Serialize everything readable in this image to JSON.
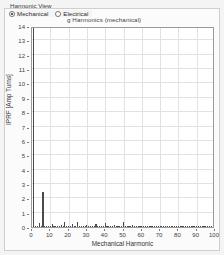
{
  "controls": {
    "group_label": "Harmonic View",
    "options": [
      {
        "label": "Mechanical",
        "selected": true
      },
      {
        "label": "Electrical",
        "selected": false
      }
    ]
  },
  "chart_data": {
    "type": "bar",
    "title": "g Harmonics (mechanical)",
    "xlabel": "Mechanical Harmonic",
    "ylabel": "IPRF [Amp Turns]",
    "xlim": [
      0,
      100
    ],
    "ylim": [
      0,
      14
    ],
    "grid": true,
    "legend": null,
    "xticks": [
      0,
      10,
      20,
      30,
      40,
      50,
      60,
      70,
      80,
      90,
      100
    ],
    "yticks": [
      0,
      1,
      2,
      3,
      4,
      5,
      6,
      7,
      8,
      9,
      10,
      11,
      12,
      13,
      14
    ],
    "bar_color": "#4a4a4a",
    "x": [
      1,
      2,
      3,
      4,
      5,
      6,
      7,
      8,
      9,
      10,
      11,
      12,
      13,
      14,
      15,
      16,
      17,
      18,
      19,
      20,
      21,
      22,
      23,
      24,
      25,
      26,
      27,
      28,
      29,
      30,
      31,
      32,
      33,
      34,
      35,
      36,
      37,
      38,
      39,
      40,
      41,
      42,
      43,
      44,
      45,
      46,
      47,
      48,
      49,
      50,
      51,
      52,
      53,
      54,
      55,
      56,
      57,
      58,
      59,
      60,
      61,
      62,
      63,
      64,
      65,
      66,
      67,
      68,
      69,
      70,
      71,
      72,
      73,
      74,
      75,
      76,
      77,
      78,
      79,
      80,
      81,
      82,
      83,
      84,
      85,
      86,
      87,
      88,
      89,
      90,
      91,
      92,
      93,
      94,
      95,
      96,
      97,
      98,
      99,
      100
    ],
    "values": [
      14.4,
      0.1,
      0.05,
      0.25,
      0.08,
      2.42,
      0.06,
      0.05,
      0.04,
      0.04,
      0.18,
      0.05,
      0.04,
      0.04,
      0.03,
      0.12,
      0.05,
      0.37,
      0.06,
      0.05,
      0.04,
      0.2,
      0.05,
      0.04,
      0.35,
      0.06,
      0.05,
      0.04,
      0.04,
      0.16,
      0.05,
      0.04,
      0.03,
      0.03,
      0.22,
      0.05,
      0.04,
      0.04,
      0.03,
      0.3,
      0.06,
      0.05,
      0.04,
      0.03,
      0.12,
      0.05,
      0.04,
      0.03,
      0.03,
      0.32,
      0.06,
      0.05,
      0.04,
      0.03,
      0.15,
      0.04,
      0.03,
      0.03,
      0.03,
      0.08,
      0.04,
      0.03,
      0.03,
      0.03,
      0.06,
      0.03,
      0.03,
      0.03,
      0.03,
      0.05,
      0.03,
      0.03,
      0.02,
      0.02,
      0.05,
      0.03,
      0.02,
      0.02,
      0.02,
      0.04,
      0.03,
      0.02,
      0.02,
      0.02,
      0.04,
      0.02,
      0.02,
      0.02,
      0.02,
      0.03,
      0.02,
      0.02,
      0.02,
      0.02,
      0.03,
      0.02,
      0.02,
      0.02,
      0.02,
      0.03
    ]
  }
}
